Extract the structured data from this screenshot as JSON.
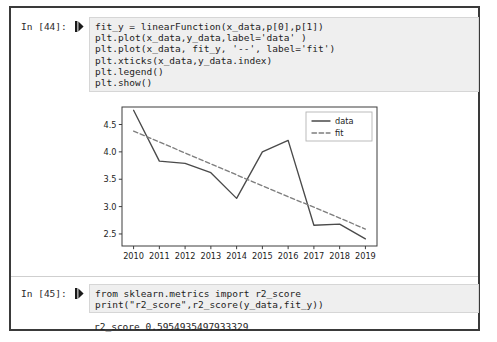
{
  "notebook": {
    "cells": [
      {
        "prompt": "In [44]:",
        "run_marker": "▶|",
        "code_lines": [
          "fit_y = linearFunction(x_data,p[0],p[1])",
          "plt.plot(x_data,y_data,label='data' )",
          "plt.plot(x_data, fit_y, '--', label='fit')",
          "plt.xticks(x_data,y_data.index)",
          "plt.legend()",
          "plt.show()"
        ]
      },
      {
        "prompt": "In [45]:",
        "run_marker": "▶|",
        "code_lines": [
          "from sklearn.metrics import r2_score",
          "print(\"r2_score\",r2_score(y_data,fit_y))"
        ],
        "output_text": "r2_score 0.5954935497933329"
      }
    ]
  },
  "chart_data": {
    "type": "line",
    "title": "",
    "xlabel": "",
    "ylabel": "",
    "x": [
      2010,
      2011,
      2012,
      2013,
      2014,
      2015,
      2016,
      2017,
      2018,
      2019
    ],
    "xticklabels": [
      "2010",
      "2011",
      "2012",
      "2013",
      "2014",
      "2015",
      "2016",
      "2017",
      "2018",
      "2019"
    ],
    "yticks": [
      2.5,
      3.0,
      3.5,
      4.0,
      4.5
    ],
    "yticklabels": [
      "2.5",
      "3.0",
      "3.5",
      "4.0",
      "4.5"
    ],
    "ylim": [
      2.28,
      4.82
    ],
    "xlim": [
      2009.55,
      2019.45
    ],
    "grid": false,
    "legend_position": "upper right",
    "series": [
      {
        "name": "data",
        "style": "solid",
        "color": "#4a4a4a",
        "values": [
          4.76,
          3.83,
          3.79,
          3.62,
          3.15,
          4.0,
          4.21,
          2.66,
          2.68,
          2.41
        ]
      },
      {
        "name": "fit",
        "style": "dashed",
        "color": "#7d7d7d",
        "values": [
          4.38,
          4.18,
          3.98,
          3.78,
          3.58,
          3.38,
          3.18,
          2.99,
          2.79,
          2.59
        ]
      }
    ]
  },
  "colors": {
    "code_background": "#efefef",
    "code_border": "#d6d6d6",
    "notebook_border": "#3a3a3a",
    "text": "#1d1d1d",
    "axis": "#3d3d3d"
  }
}
